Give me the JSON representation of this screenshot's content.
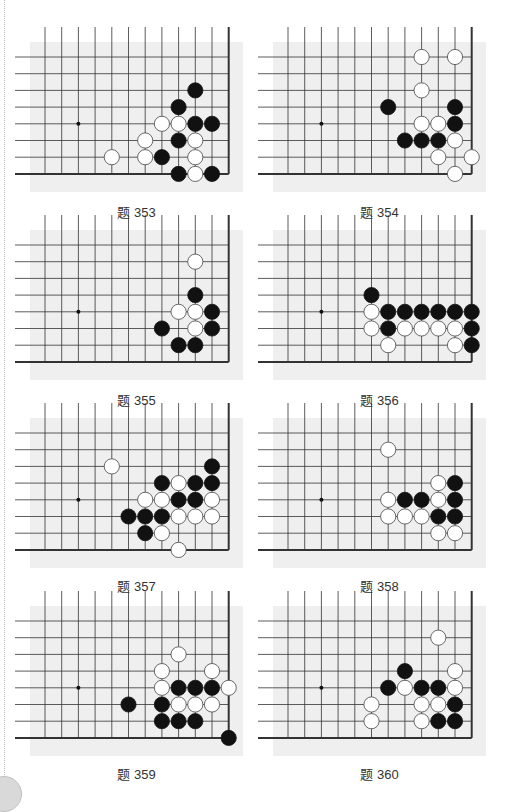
{
  "page": {
    "page_number_badge": "",
    "grid": {
      "cols": 12,
      "rows": 8,
      "spacing": 16.7,
      "star_point": [
        2,
        4
      ],
      "right_edge_col": 11,
      "bottom_edge_row": 7
    },
    "colors": {
      "board_bg": "#efefef",
      "line": "#333333",
      "black_stone": "#111111",
      "white_stone": "#ffffff",
      "white_stone_border": "#444444"
    }
  },
  "problems": [
    {
      "caption": "题 353",
      "black": [
        [
          9,
          2
        ],
        [
          8,
          3
        ],
        [
          9,
          4
        ],
        [
          10,
          4
        ],
        [
          8,
          5
        ],
        [
          7,
          6
        ],
        [
          8,
          7
        ],
        [
          10,
          7
        ]
      ],
      "white": [
        [
          7,
          4
        ],
        [
          8,
          4
        ],
        [
          6,
          5
        ],
        [
          9,
          5
        ],
        [
          4,
          6
        ],
        [
          6,
          6
        ],
        [
          9,
          6
        ],
        [
          9,
          7
        ]
      ]
    },
    {
      "caption": "题 354",
      "black": [
        [
          6,
          3
        ],
        [
          10,
          3
        ],
        [
          10,
          4
        ],
        [
          7,
          5
        ],
        [
          8,
          5
        ],
        [
          9,
          5
        ]
      ],
      "white": [
        [
          8,
          0
        ],
        [
          10,
          0
        ],
        [
          8,
          2
        ],
        [
          8,
          4
        ],
        [
          9,
          4
        ],
        [
          10,
          5
        ],
        [
          9,
          6
        ],
        [
          11,
          6
        ],
        [
          10,
          7
        ]
      ]
    },
    {
      "caption": "题 355",
      "black": [
        [
          9,
          3
        ],
        [
          10,
          4
        ],
        [
          7,
          5
        ],
        [
          10,
          5
        ],
        [
          8,
          6
        ],
        [
          9,
          6
        ]
      ],
      "white": [
        [
          9,
          1
        ],
        [
          8,
          4
        ],
        [
          9,
          4
        ],
        [
          9,
          5
        ]
      ]
    },
    {
      "caption": "题 356",
      "black": [
        [
          5,
          3
        ],
        [
          6,
          4
        ],
        [
          7,
          4
        ],
        [
          8,
          4
        ],
        [
          9,
          4
        ],
        [
          10,
          4
        ],
        [
          11,
          4
        ],
        [
          6,
          5
        ],
        [
          11,
          5
        ],
        [
          11,
          6
        ]
      ],
      "white": [
        [
          5,
          4
        ],
        [
          5,
          5
        ],
        [
          7,
          5
        ],
        [
          8,
          5
        ],
        [
          9,
          5
        ],
        [
          10,
          5
        ],
        [
          6,
          6
        ],
        [
          10,
          6
        ]
      ]
    },
    {
      "caption": "题 357",
      "black": [
        [
          10,
          2
        ],
        [
          7,
          3
        ],
        [
          9,
          3
        ],
        [
          10,
          3
        ],
        [
          8,
          4
        ],
        [
          9,
          4
        ],
        [
          5,
          5
        ],
        [
          6,
          5
        ],
        [
          7,
          5
        ],
        [
          6,
          6
        ]
      ],
      "white": [
        [
          4,
          2
        ],
        [
          8,
          3
        ],
        [
          6,
          4
        ],
        [
          7,
          4
        ],
        [
          10,
          4
        ],
        [
          8,
          5
        ],
        [
          9,
          5
        ],
        [
          10,
          5
        ],
        [
          7,
          6
        ],
        [
          8,
          7
        ]
      ]
    },
    {
      "caption": "题 358",
      "black": [
        [
          10,
          3
        ],
        [
          7,
          4
        ],
        [
          8,
          4
        ],
        [
          10,
          4
        ],
        [
          9,
          5
        ],
        [
          10,
          5
        ]
      ],
      "white": [
        [
          6,
          1
        ],
        [
          9,
          3
        ],
        [
          6,
          4
        ],
        [
          9,
          4
        ],
        [
          6,
          5
        ],
        [
          7,
          5
        ],
        [
          8,
          5
        ],
        [
          9,
          6
        ],
        [
          10,
          6
        ]
      ]
    },
    {
      "caption": "题 359",
      "black": [
        [
          8,
          4
        ],
        [
          9,
          4
        ],
        [
          10,
          4
        ],
        [
          5,
          5
        ],
        [
          7,
          5
        ],
        [
          7,
          6
        ],
        [
          8,
          6
        ],
        [
          9,
          6
        ],
        [
          11,
          7
        ]
      ],
      "white": [
        [
          8,
          2
        ],
        [
          7,
          3
        ],
        [
          10,
          3
        ],
        [
          7,
          4
        ],
        [
          11,
          4
        ],
        [
          8,
          5
        ],
        [
          9,
          5
        ],
        [
          10,
          5
        ]
      ]
    },
    {
      "caption": "题 360",
      "black": [
        [
          7,
          3
        ],
        [
          6,
          4
        ],
        [
          8,
          4
        ],
        [
          9,
          4
        ],
        [
          10,
          5
        ],
        [
          9,
          6
        ],
        [
          10,
          6
        ]
      ],
      "white": [
        [
          9,
          1
        ],
        [
          10,
          3
        ],
        [
          7,
          4
        ],
        [
          10,
          4
        ],
        [
          5,
          5
        ],
        [
          8,
          5
        ],
        [
          9,
          5
        ],
        [
          5,
          6
        ],
        [
          8,
          6
        ]
      ]
    }
  ]
}
